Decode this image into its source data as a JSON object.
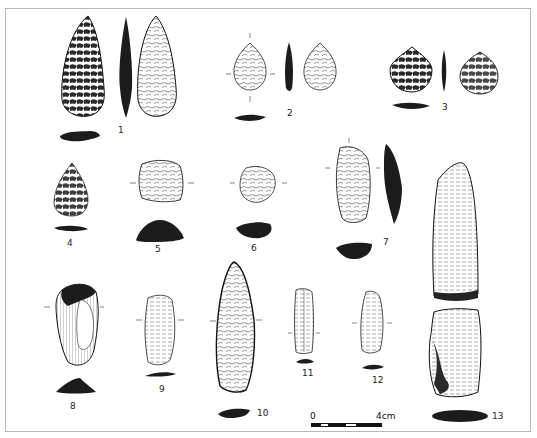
{
  "figure": {
    "type": "archaeological lithic artifact plate",
    "frame_color": "#b8b8b8",
    "ink_color": "#1a1a1a",
    "artifacts": [
      {
        "label": "1",
        "description": "bifacial leaf-shaped point, two faces and profile with section"
      },
      {
        "label": "2",
        "description": "small bifacial point, two faces and profile with section"
      },
      {
        "label": "3",
        "description": "small bifacial point, dark flaking, two faces and profile with section"
      },
      {
        "label": "4",
        "description": "small pointed biface with section"
      },
      {
        "label": "5",
        "description": "end scraper with thick section"
      },
      {
        "label": "6",
        "description": "round scraper with section"
      },
      {
        "label": "7",
        "description": "elongated tool with profile and section"
      },
      {
        "label": "8",
        "description": "cortical tool with triangular section"
      },
      {
        "label": "9",
        "description": "flake tool with section"
      },
      {
        "label": "10",
        "description": "long blade with section"
      },
      {
        "label": "11",
        "description": "bladelet with section"
      },
      {
        "label": "12",
        "description": "bladelet with section"
      },
      {
        "label": "13",
        "description": "core (two views) with section"
      }
    ]
  },
  "scale_bar": {
    "start_label": "0",
    "end_label": "4cm"
  }
}
